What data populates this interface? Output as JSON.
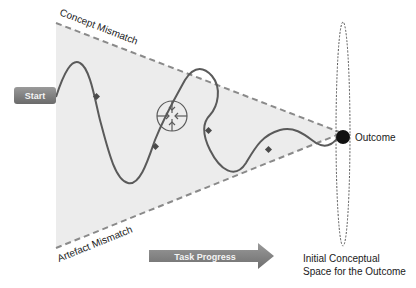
{
  "diagram": {
    "start_label": "Start",
    "outcome_label": "Outcome",
    "top_boundary_label": "Concept Mismatch",
    "bottom_boundary_label": "Artefact Mismatch",
    "progress_label": "Task Progress",
    "space_label_line1": "Initial Conceptual",
    "space_label_line2": "Space for the Outcome",
    "colors": {
      "funnel_fill": "#ececec",
      "boundary": "#8a8a8a",
      "path": "#5a5a5a",
      "marker": "#4a4a4a",
      "start_box": "#7a7a7a",
      "progress_arrow": "#7d7d7d",
      "outcome_dot": "#111111"
    }
  }
}
